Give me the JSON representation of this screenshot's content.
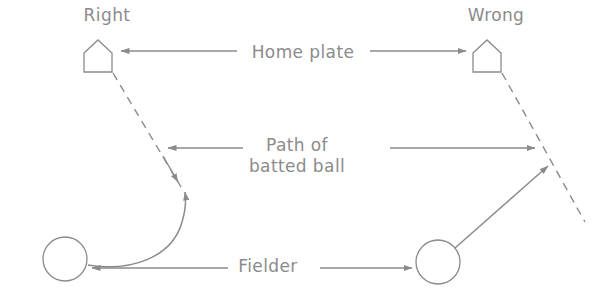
{
  "figure": {
    "type": "instructional-diagram",
    "width": 608,
    "height": 303,
    "background_color": "#ffffff",
    "ink_color": "#8b8b8b"
  },
  "labels": {
    "left_panel_title": "Right",
    "right_panel_title": "Wrong",
    "home_plate": "Home plate",
    "path_of_batted_ball_line1": "Path of",
    "path_of_batted_ball_line2": "batted ball",
    "fielder": "Fielder"
  },
  "icons": {
    "home_plate_left": "home-plate-pentagon-icon",
    "home_plate_right": "home-plate-pentagon-icon",
    "fielder_left": "fielder-circle-icon",
    "fielder_right": "fielder-circle-icon"
  },
  "callouts": [
    {
      "name": "home-plate-callout",
      "label": "Home plate",
      "arrow_left_target": "left home plate pentagon",
      "arrow_right_target": "right home plate pentagon",
      "arrow_direction": "both"
    },
    {
      "name": "batted-ball-callout",
      "label": "Path of batted ball",
      "arrow_left_target": "left dashed ball path",
      "arrow_right_target": "right dashed ball path",
      "arrow_direction": "both"
    },
    {
      "name": "fielder-callout",
      "label": "Fielder",
      "arrow_left_target": "left fielder circle",
      "arrow_right_target": "right fielder circle",
      "arrow_direction": "both"
    }
  ],
  "panels": {
    "left": {
      "title": "Right",
      "ball_path_style": "dashed",
      "fielder_route_style": "curved-arc",
      "description": "Fielder loops around and approaches the ball moving toward home plate"
    },
    "right": {
      "title": "Wrong",
      "ball_path_style": "dashed",
      "fielder_route_style": "straight-line",
      "description": "Fielder runs straight at the ball"
    }
  }
}
